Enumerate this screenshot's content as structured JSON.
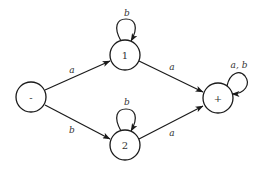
{
  "diagram": {
    "type": "finite-automaton",
    "colors": {
      "stroke": "#1a1a1a",
      "text": "#333333",
      "background": "#ffffff"
    },
    "nodes": [
      {
        "id": "start",
        "label": "-",
        "role": "start"
      },
      {
        "id": "q1",
        "label": "1",
        "role": "intermediate"
      },
      {
        "id": "q2",
        "label": "2",
        "role": "intermediate"
      },
      {
        "id": "accept",
        "label": "+",
        "role": "accepting"
      }
    ],
    "edges": [
      {
        "from": "start",
        "to": "q1",
        "label": "a"
      },
      {
        "from": "start",
        "to": "q2",
        "label": "b"
      },
      {
        "from": "q1",
        "to": "accept",
        "label": "a"
      },
      {
        "from": "q2",
        "to": "accept",
        "label": "a"
      },
      {
        "from": "q1",
        "to": "q1",
        "label": "b"
      },
      {
        "from": "q2",
        "to": "q2",
        "label": "b"
      },
      {
        "from": "accept",
        "to": "accept",
        "label": "a, b"
      }
    ]
  }
}
